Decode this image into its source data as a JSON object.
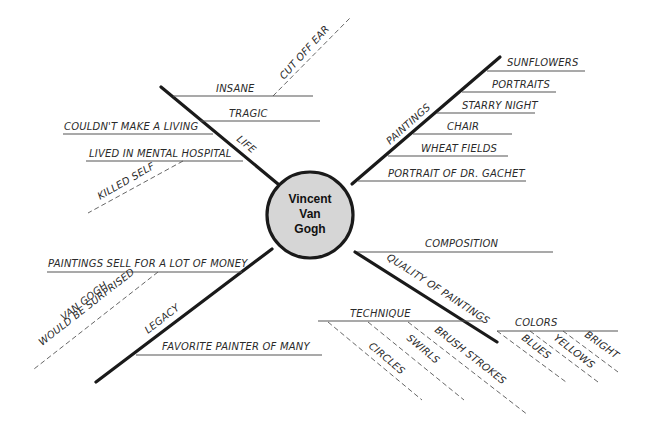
{
  "diagram": {
    "type": "mind-map",
    "center": {
      "lines": [
        "Vincent",
        "Van",
        "Gogh"
      ],
      "fill": "#d6d6d6",
      "stroke": "#1a1a1a"
    },
    "branches": [
      {
        "label": "LIFE",
        "items": [
          {
            "label": "INSANE",
            "sub": [
              {
                "label": "CUT OFF EAR"
              }
            ]
          },
          {
            "label": "TRAGIC"
          },
          {
            "label": "COULDN'T MAKE A LIVING"
          },
          {
            "label": "LIVED IN MENTAL HOSPITAL",
            "sub": [
              {
                "label": "KILLED SELF"
              }
            ]
          }
        ]
      },
      {
        "label": "PAINTINGS",
        "items": [
          {
            "label": "SUNFLOWERS"
          },
          {
            "label": "PORTRAITS"
          },
          {
            "label": "STARRY NIGHT"
          },
          {
            "label": "CHAIR"
          },
          {
            "label": "WHEAT FIELDS"
          },
          {
            "label": "PORTRAIT OF DR. GACHET"
          }
        ]
      },
      {
        "label": "LEGACY",
        "items": [
          {
            "label": "PAINTINGS SELL FOR A LOT OF MONEY",
            "sub": [
              {
                "label": "VAN GOGH",
                "label2": "WOULD BE SURPRISED"
              }
            ]
          },
          {
            "label": "FAVORITE PAINTER OF MANY"
          }
        ]
      },
      {
        "label": "QUALITY OF PAINTINGS",
        "items": [
          {
            "label": "COMPOSITION"
          },
          {
            "label": "TECHNIQUE",
            "sub": [
              {
                "label": "CIRCLES"
              },
              {
                "label": "SWIRLS"
              },
              {
                "label": "BRUSH STROKES"
              }
            ]
          },
          {
            "label": "COLORS",
            "sub": [
              {
                "label": "BLUES"
              },
              {
                "label": "YELLOWS"
              },
              {
                "label": "BRIGHT"
              }
            ]
          }
        ]
      }
    ]
  }
}
